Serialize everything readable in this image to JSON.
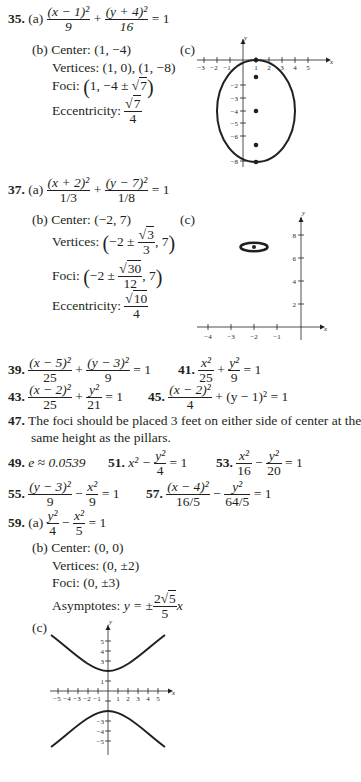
{
  "answers": {
    "p35": {
      "number": "35.",
      "a_label": "(a)",
      "a_eq": {
        "t1_num": "(x − 1)²",
        "t1_den": "9",
        "plus": "+",
        "t2_num": "(y + 4)²",
        "t2_den": "16",
        "rhs": "= 1"
      },
      "b_label": "(b)",
      "center_label": "Center:",
      "center_value": "(1, −4)",
      "vertices_label": "Vertices:",
      "vertices_value": "(1, 0), (1, −8)",
      "foci_label": "Foci:",
      "foci_value_pre": "1, −4 ±",
      "foci_value_sqrt": "7",
      "ecc_label": "Eccentricity:",
      "ecc_num_sqrt": "7",
      "ecc_den": "4",
      "c_label": "(c)"
    },
    "p37": {
      "number": "37.",
      "a_label": "(a)",
      "a_eq": {
        "t1_num": "(x + 2)²",
        "t1_den": "1/3",
        "plus": "+",
        "t2_num": "(y − 7)²",
        "t2_den": "1/8",
        "rhs": "= 1"
      },
      "b_label": "(b)",
      "center_label": "Center:",
      "center_value": "(−2, 7)",
      "vertices_label": "Vertices:",
      "vertices_pre": "−2 ±",
      "vertices_sqrt": "3",
      "vertices_den": "3",
      "vertices_post": ", 7",
      "foci_label": "Foci:",
      "foci_pre": "−2 ±",
      "foci_sqrt": "30",
      "foci_den": "12",
      "foci_post": ", 7",
      "ecc_label": "Eccentricity:",
      "ecc_num_sqrt": "10",
      "ecc_den": "4",
      "c_label": "(c)"
    },
    "p39": {
      "number": "39.",
      "t1_num": "(x − 5)²",
      "t1_den": "25",
      "plus": "+",
      "t2_num": "(y − 3)²",
      "t2_den": "9",
      "rhs": "= 1"
    },
    "p41": {
      "number": "41.",
      "t1_num": "x²",
      "t1_den": "25",
      "plus": "+",
      "t2_num": "y²",
      "t2_den": "9",
      "rhs": "= 1"
    },
    "p43": {
      "number": "43.",
      "t1_num": "(x − 2)²",
      "t1_den": "25",
      "plus": "+",
      "t2_num": "y²",
      "t2_den": "21",
      "rhs": "= 1"
    },
    "p45": {
      "number": "45.",
      "t1_num": "(x − 2)²",
      "t1_den": "4",
      "rest": "+ (y − 1)² = 1"
    },
    "p47": {
      "number": "47.",
      "line1": "The foci should be placed 3 feet on either side of center at the",
      "line2": "same height as the pillars."
    },
    "p49": {
      "number": "49.",
      "text": "e ≈ 0.0539"
    },
    "p51": {
      "number": "51.",
      "pre": "x² −",
      "t_num": "y²",
      "t_den": "4",
      "rhs": "= 1"
    },
    "p53": {
      "number": "53.",
      "t1_num": "x²",
      "t1_den": "16",
      "minus": "−",
      "t2_num": "y²",
      "t2_den": "20",
      "rhs": "= 1"
    },
    "p55": {
      "number": "55.",
      "t1_num": "(y − 3)²",
      "t1_den": "9",
      "minus": "−",
      "t2_num": "x²",
      "t2_den": "9",
      "rhs": "= 1"
    },
    "p57": {
      "number": "57.",
      "t1_num": "(x − 4)²",
      "t1_den": "16/5",
      "minus": "−",
      "t2_num": "y²",
      "t2_den": "64/5",
      "rhs": "= 1"
    },
    "p59": {
      "number": "59.",
      "a_label": "(a)",
      "a_eq": {
        "t1_num": "y²",
        "t1_den": "4",
        "minus": "−",
        "t2_num": "x²",
        "t2_den": "5",
        "rhs": "= 1"
      },
      "b_label": "(b)",
      "center_label": "Center:",
      "center_value": "(0, 0)",
      "vertices_label": "Vertices:",
      "vertices_value": "(0, ±2)",
      "foci_label": "Foci:",
      "foci_value": "(0, ±3)",
      "asym_label": "Asymptotes:",
      "asym_pre": "y = ±",
      "asym_num_coef": "2",
      "asym_num_sqrt": "5",
      "asym_den": "5",
      "asym_post": "x",
      "c_label": "(c)"
    }
  },
  "graphs": {
    "ellipse35": {
      "axis_x_label": "x",
      "axis_y_label": "y",
      "x_ticks": [
        "−3",
        "−2",
        "−1",
        "1",
        "2",
        "3",
        "4",
        "5"
      ],
      "y_ticks": [
        "−2",
        "−3",
        "−4",
        "−5",
        "−6",
        "−8"
      ],
      "center": [
        1,
        -4
      ],
      "a_vertical": 4,
      "b_horizontal": 3,
      "points": [
        [
          1,
          0
        ],
        [
          1,
          -1.35
        ],
        [
          1,
          -4
        ],
        [
          1,
          -6.65
        ],
        [
          1,
          -8
        ]
      ]
    },
    "ellipse37": {
      "axis_x_label": "x",
      "axis_y_label": "y",
      "x_ticks": [
        "−4",
        "−3",
        "−2",
        "−1"
      ],
      "y_ticks": [
        "2",
        "4",
        "6",
        "8"
      ],
      "center": [
        -2,
        7
      ]
    },
    "hyperbola59": {
      "axis_x_label": "x",
      "axis_y_label": "y",
      "x_ticks": [
        "−5",
        "−4",
        "−3",
        "−2",
        "−1",
        "1",
        "2",
        "3",
        "4",
        "5"
      ],
      "y_ticks": [
        "5",
        "4",
        "3",
        "1",
        "−3",
        "−4",
        "−5"
      ]
    }
  }
}
